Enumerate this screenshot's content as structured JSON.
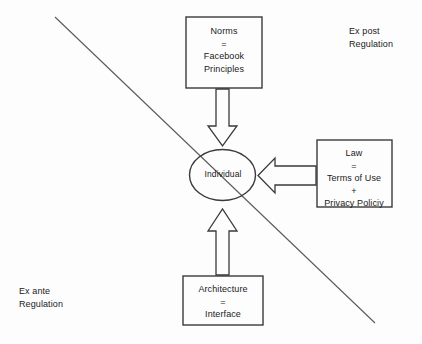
{
  "diagram": {
    "background_color": "#fdfdfd",
    "stroke_color": "#3a3a3a",
    "text_color": "#1a1a1a",
    "nodes": {
      "norms": {
        "line1": "Norms",
        "line2": "=",
        "line3": "Facebook",
        "line4": "Principles"
      },
      "law": {
        "line1": "Law",
        "line2": "=",
        "line3": "Terms of Use",
        "line4": "+",
        "line5": "Privacy Policiy"
      },
      "architecture": {
        "line1": "Architecture",
        "line2": "=",
        "line3": "Interface"
      },
      "individual": {
        "label": "Individual"
      }
    },
    "corner_labels": {
      "top_right": {
        "line1": "Ex post",
        "line2": "Regulation"
      },
      "bottom_left": {
        "line1": "Ex ante",
        "line2": "Regulation"
      }
    },
    "arrows": [
      {
        "name": "norms-to-individual",
        "direction": "down"
      },
      {
        "name": "law-to-individual",
        "direction": "left"
      },
      {
        "name": "architecture-to-individual",
        "direction": "up"
      }
    ],
    "divider": {
      "name": "ex-ante-ex-post-divider",
      "description": "diagonal line from upper-left to lower-right"
    }
  }
}
